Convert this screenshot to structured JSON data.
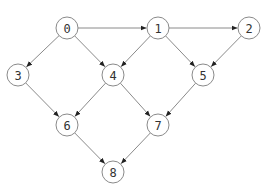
{
  "diagram": {
    "type": "directed-graph",
    "colors": {
      "edge": "#8a8a8a",
      "arrowhead": "#222222",
      "node_stroke": "#8a8a8a",
      "node_fill": "#ffffff",
      "label": "#333333"
    },
    "node_radius": 11,
    "nodes": [
      {
        "id": "0",
        "label": "0",
        "x": 67,
        "y": 28
      },
      {
        "id": "1",
        "label": "1",
        "x": 158,
        "y": 28
      },
      {
        "id": "2",
        "label": "2",
        "x": 249,
        "y": 28
      },
      {
        "id": "3",
        "label": "3",
        "x": 18,
        "y": 75
      },
      {
        "id": "4",
        "label": "4",
        "x": 113,
        "y": 75
      },
      {
        "id": "5",
        "label": "5",
        "x": 203,
        "y": 75
      },
      {
        "id": "6",
        "label": "6",
        "x": 67,
        "y": 125
      },
      {
        "id": "7",
        "label": "7",
        "x": 158,
        "y": 125
      },
      {
        "id": "8",
        "label": "8",
        "x": 113,
        "y": 172
      }
    ],
    "edges": [
      {
        "from": "0",
        "to": "1"
      },
      {
        "from": "0",
        "to": "3"
      },
      {
        "from": "0",
        "to": "4"
      },
      {
        "from": "1",
        "to": "2"
      },
      {
        "from": "1",
        "to": "4"
      },
      {
        "from": "1",
        "to": "5"
      },
      {
        "from": "2",
        "to": "5"
      },
      {
        "from": "3",
        "to": "6"
      },
      {
        "from": "4",
        "to": "6"
      },
      {
        "from": "4",
        "to": "7"
      },
      {
        "from": "5",
        "to": "7"
      },
      {
        "from": "6",
        "to": "8"
      },
      {
        "from": "7",
        "to": "8"
      }
    ]
  }
}
